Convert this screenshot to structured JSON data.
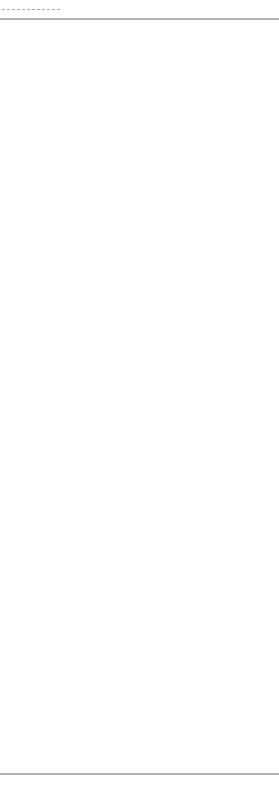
{
  "legend": {
    "label": "Valley fold line (concave)",
    "line_style": "dashed"
  },
  "colors": {
    "line": "#555555",
    "legend_text": "#666666",
    "frame": "#666666"
  },
  "frame": {
    "top_y": 19,
    "bottom_y": 774
  },
  "center_x": 129,
  "units": [
    {
      "offset": 0
    },
    {
      "offset": 229
    },
    {
      "offset": 457
    }
  ]
}
